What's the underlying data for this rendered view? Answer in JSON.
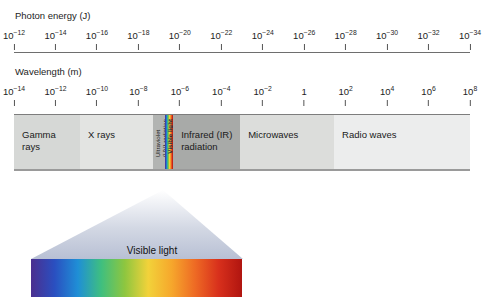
{
  "axes": {
    "photon_energy": {
      "title": "Photon energy (J)",
      "base": "10",
      "exponents": [
        "-12",
        "-14",
        "-16",
        "-18",
        "-20",
        "-22",
        "-24",
        "-26",
        "-28",
        "-30",
        "-32",
        "-34"
      ]
    },
    "wavelength": {
      "title": "Wavelength (m)",
      "base": "10",
      "exponents": [
        "-14",
        "-12",
        "-10",
        "-8",
        "-6",
        "-4",
        "-2",
        "0",
        "2",
        "4",
        "6",
        "8"
      ]
    }
  },
  "spectrum": {
    "regions": [
      {
        "label": "Gamma\nrays",
        "color": "#d6d8d6",
        "orientation": "horizontal"
      },
      {
        "label": "X rays",
        "color": "#e3e4e2",
        "orientation": "horizontal"
      },
      {
        "label": "Ultraviolet\n(UV) radiation",
        "color": "#b2b4b2",
        "orientation": "vertical"
      },
      {
        "label": "Visible light",
        "color": "rainbow",
        "orientation": "vertical"
      },
      {
        "label": "Infrared (IR)\nradiation",
        "color": "#a8aaa8",
        "orientation": "horizontal"
      },
      {
        "label": "Microwaves",
        "color": "#dcdddb",
        "orientation": "horizontal"
      },
      {
        "label": "Radio waves",
        "color": "#eceded",
        "orientation": "horizontal"
      }
    ]
  },
  "callout": {
    "caption": "Visible light",
    "cone_color": "#c3c9da",
    "gradient_stops": [
      "#4b2f8f",
      "#2a4fc0",
      "#1f8fd6",
      "#3fbf7f",
      "#8ec63f",
      "#f2d23a",
      "#f6a72c",
      "#ee6a24",
      "#d8301c",
      "#b01510"
    ]
  },
  "chart_data": {
    "type": "diagram",
    "axes": [
      {
        "name": "Photon energy (J)",
        "position": "top",
        "tick_values": [
          "10^-12",
          "10^-14",
          "10^-16",
          "10^-18",
          "10^-20",
          "10^-22",
          "10^-24",
          "10^-26",
          "10^-28",
          "10^-30",
          "10^-32",
          "10^-34"
        ],
        "direction": "decreasing-left-to-right"
      },
      {
        "name": "Wavelength (m)",
        "position": "middle",
        "tick_values": [
          "10^-14",
          "10^-12",
          "10^-10",
          "10^-8",
          "10^-6",
          "10^-4",
          "10^-2",
          "1",
          "10^2",
          "10^4",
          "10^6",
          "10^8"
        ],
        "direction": "increasing-left-to-right"
      }
    ],
    "bands": [
      {
        "name": "Gamma rays",
        "start_pct": 0,
        "end_pct": 14.5
      },
      {
        "name": "X rays",
        "start_pct": 14.5,
        "end_pct": 30.5
      },
      {
        "name": "Ultraviolet (UV) radiation",
        "start_pct": 30.5,
        "end_pct": 33.2
      },
      {
        "name": "Visible light",
        "start_pct": 33.2,
        "end_pct": 34.9
      },
      {
        "name": "Infrared (IR) radiation",
        "start_pct": 34.9,
        "end_pct": 49.6
      },
      {
        "name": "Microwaves",
        "start_pct": 49.6,
        "end_pct": 70.2
      },
      {
        "name": "Radio waves",
        "start_pct": 70.2,
        "end_pct": 100
      }
    ],
    "callout": {
      "source_band": "Visible light",
      "caption": "Visible light"
    }
  }
}
